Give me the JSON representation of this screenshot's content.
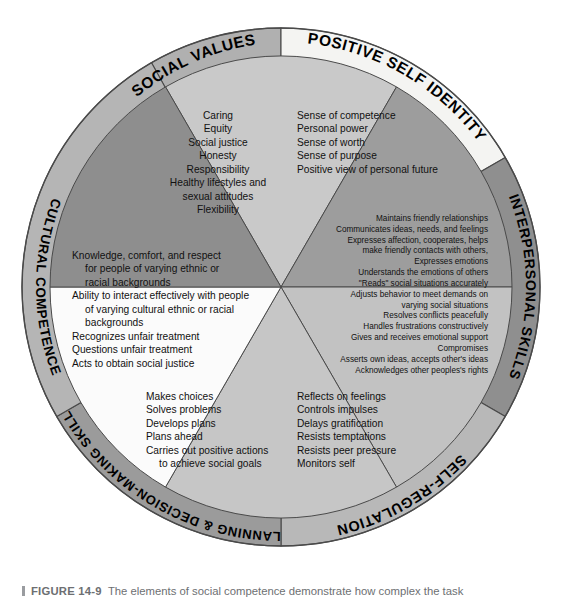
{
  "figure": {
    "caption_label": "FIGURE 14-9",
    "caption_text": "The elements of social competence demonstrate how complex the task",
    "title_hidden": "Elements of Social Competence"
  },
  "colors": {
    "ring_social_values": "#b0b0b0",
    "ring_positive_self_identity": "#f4f4f2",
    "ring_interpersonal_skills": "#8f8f8f",
    "ring_self_regulation": "#b8b8b8",
    "ring_planning": "#9b9b9b",
    "ring_cultural_competence": "#b5b5b5",
    "sector_social_values": "#c9c9c9",
    "sector_positive_self_identity": "#9d9d9d",
    "sector_interpersonal_skills": "#c2c2c2",
    "sector_self_regulation": "#c6c6c6",
    "sector_planning": "#fbfbfb",
    "sector_cultural_competence": "#8e8e8e",
    "outline": "#4a4a4a",
    "text": "#111111",
    "caption": "#6d6f72"
  },
  "wheel": {
    "center_x": 281,
    "center_y": 287,
    "outer_radius": 259,
    "inner_radius": 231,
    "ring_labels": [
      {
        "id": "social-values",
        "text": "SOCIAL VALUES"
      },
      {
        "id": "positive-self-identity",
        "text": "POSITIVE SELF IDENTITY"
      },
      {
        "id": "interpersonal-skills",
        "text": "INTERPERSONAL SKILLS"
      },
      {
        "id": "self-regulation",
        "text": "SELF-REGULATION"
      },
      {
        "id": "planning-decision-making-skills",
        "text": "PLANNING & DECISION-MAKING SKILLS"
      },
      {
        "id": "cultural-competence",
        "text": "CULTURAL COMPETENCE"
      }
    ],
    "sectors": [
      {
        "id": "social-values",
        "label": "SOCIAL VALUES",
        "align": "center",
        "items": [
          "Caring",
          "Equity",
          "Social justice",
          "Honesty",
          "Responsibility",
          "Healthy lifestyles and",
          "sexual attitudes",
          "Flexibility"
        ]
      },
      {
        "id": "positive-self-identity",
        "label": "POSITIVE SELF IDENTITY",
        "align": "left",
        "items": [
          "Sense of competence",
          "Personal power",
          "Sense of worth",
          "Sense of purpose",
          "Positive view of personal future"
        ]
      },
      {
        "id": "interpersonal-skills",
        "label": "INTERPERSONAL SKILLS",
        "align": "right",
        "items": [
          "Maintains friendly relationships",
          "Communicates ideas, needs, and feelings",
          "Expresses affection, cooperates, helps",
          "make friendly contacts with others,",
          "Expresses emotions",
          "Understands the emotions of others",
          "\"Reads\" social situations accurately",
          "Adjusts behavior to meet demands on",
          "varying social situations",
          "Resolves conflicts peacefully",
          "Handles frustrations constructively",
          "Gives and receives emotional support",
          "Compromises",
          "Asserts own ideas, accepts other's ideas",
          "Acknowledges other peoples's rights"
        ]
      },
      {
        "id": "self-regulation",
        "label": "SELF-REGULATION",
        "align": "left",
        "items": [
          "Reflects on feelings",
          "Controls impulses",
          "Delays gratification",
          "Resists temptations",
          "Resists peer pressure",
          "Monitors self"
        ]
      },
      {
        "id": "planning-decision-making-skills",
        "label": "PLANNING & DECISION-MAKING SKILLS",
        "align": "left",
        "items": [
          "Makes choices",
          "Solves problems",
          "Develops plans",
          "Plans ahead",
          "Carries out positive actions",
          "    to achieve social goals"
        ]
      },
      {
        "id": "cultural-competence",
        "label": "CULTURAL COMPETENCE",
        "align": "left",
        "items": [
          "Knowledge, comfort, and respect",
          "    for people of varying ethnic or",
          "    racial backgrounds",
          "Ability to interact effectively with people",
          "    of varying cultural ethnic or racial",
          "    backgrounds",
          "Recognizes unfair treatment",
          "Questions unfair treatment",
          "Acts to obtain social justice"
        ]
      }
    ]
  }
}
